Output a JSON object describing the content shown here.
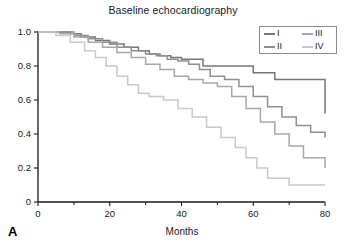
{
  "figure": {
    "panel_label": "A"
  },
  "chart_data": {
    "type": "line",
    "subtype": "kaplan-meier-step",
    "title": "Baseline echocardiography",
    "xlabel": "Months",
    "ylabel": "",
    "xlim": [
      0,
      80
    ],
    "ylim": [
      0,
      1.0
    ],
    "grid": false,
    "legend_position": "top-right",
    "x_ticks": [
      0,
      20,
      40,
      60,
      80
    ],
    "x_tick_labels": [
      "0",
      "20",
      "40",
      "60",
      "80"
    ],
    "x_minor_ticks": [
      10,
      30,
      50,
      70
    ],
    "y_ticks": [
      0,
      0.2,
      0.4,
      0.6,
      0.8,
      1.0
    ],
    "y_tick_labels": [
      "0",
      "0.2",
      "0.4",
      "0.6",
      "0.8",
      "1.0"
    ],
    "legend": [
      {
        "name": "I",
        "color": "#777777"
      },
      {
        "name": "II",
        "color": "#8f8f8f"
      },
      {
        "name": "III",
        "color": "#a8a8a8"
      },
      {
        "name": "IV",
        "color": "#c9c9c9"
      }
    ],
    "series": [
      {
        "name": "I",
        "color": "#777777",
        "x": [
          0,
          6,
          9,
          12,
          16,
          20,
          24,
          28,
          31,
          34,
          37,
          40,
          44,
          46,
          52,
          60,
          63,
          66,
          80
        ],
        "y": [
          1.0,
          1.0,
          0.99,
          0.97,
          0.95,
          0.93,
          0.91,
          0.89,
          0.87,
          0.86,
          0.85,
          0.84,
          0.84,
          0.8,
          0.8,
          0.76,
          0.76,
          0.72,
          0.72
        ],
        "final_value": 0.52
      },
      {
        "name": "II",
        "color": "#8f8f8f",
        "x": [
          0,
          6,
          10,
          14,
          18,
          22,
          26,
          30,
          33,
          36,
          39,
          42,
          45,
          48,
          52,
          56,
          60,
          64,
          68,
          72,
          76,
          80
        ],
        "y": [
          1.0,
          1.0,
          0.98,
          0.96,
          0.94,
          0.91,
          0.89,
          0.87,
          0.86,
          0.84,
          0.83,
          0.81,
          0.78,
          0.74,
          0.72,
          0.68,
          0.62,
          0.56,
          0.5,
          0.45,
          0.41,
          0.38
        ],
        "final_value": 0.38
      },
      {
        "name": "III",
        "color": "#a8a8a8",
        "x": [
          0,
          6,
          10,
          14,
          18,
          22,
          26,
          30,
          34,
          38,
          42,
          46,
          50,
          54,
          58,
          62,
          66,
          70,
          74,
          80
        ],
        "y": [
          1.0,
          0.99,
          0.97,
          0.94,
          0.91,
          0.88,
          0.85,
          0.81,
          0.78,
          0.74,
          0.72,
          0.7,
          0.68,
          0.62,
          0.55,
          0.47,
          0.4,
          0.33,
          0.26,
          0.2
        ],
        "final_value": 0.2
      },
      {
        "name": "IV",
        "color": "#c9c9c9",
        "x": [
          0,
          5,
          9,
          13,
          16,
          19,
          22,
          25,
          28,
          31,
          35,
          39,
          43,
          47,
          51,
          55,
          58,
          61,
          64,
          70,
          80
        ],
        "y": [
          1.0,
          0.98,
          0.94,
          0.89,
          0.85,
          0.8,
          0.74,
          0.69,
          0.64,
          0.62,
          0.6,
          0.55,
          0.5,
          0.44,
          0.38,
          0.32,
          0.26,
          0.2,
          0.14,
          0.1,
          0.1
        ],
        "final_value": 0.1
      }
    ]
  }
}
